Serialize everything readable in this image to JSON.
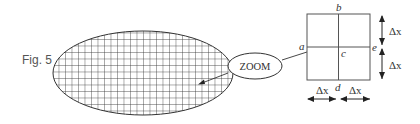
{
  "figure": {
    "label": "Fig. 5",
    "callout_label": "ZOOM",
    "grid_region": {
      "shape": "ellipse",
      "fill_pattern": "square-grid-mesh"
    },
    "zoomed_cell": {
      "node_labels": {
        "left": "a",
        "top": "b",
        "center": "c",
        "bottom": "d",
        "right": "e"
      },
      "spacing_labels": {
        "right_upper": "Δx",
        "right_lower": "Δx",
        "bottom_left": "Δx",
        "bottom_right": "Δx"
      }
    },
    "colors": {
      "line": "#333333",
      "label": "#555555",
      "background": "#ffffff"
    }
  }
}
